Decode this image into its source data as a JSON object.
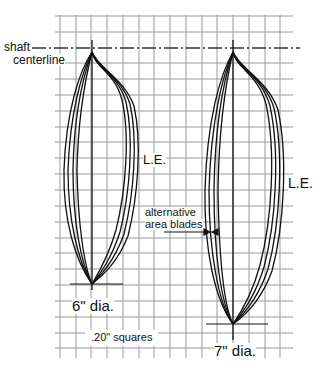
{
  "labels": {
    "shaft_centerline": [
      "shaft",
      "centerline"
    ],
    "le_left": "L.E.",
    "le_right": "L.E.",
    "alternative": [
      "alternative",
      "area blades"
    ],
    "dia6": "6\" dia.",
    "dia7": "7\" dia.",
    "squares": ".20\" squares"
  },
  "colors": {
    "grid": "#9a9a9a",
    "line": "#111111"
  }
}
